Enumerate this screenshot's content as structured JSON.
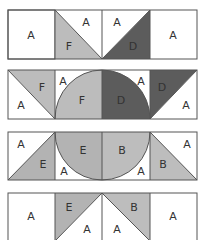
{
  "colors": {
    "A": "#ffffff",
    "B": "#bdbdbd",
    "D": "#5c5c5c",
    "E": "#b3b3b3",
    "F": "#bcbcbc",
    "outline": "#666666"
  },
  "rows": [
    {
      "labels": [
        "A",
        "F",
        "A",
        "A",
        "D",
        "A"
      ]
    },
    {
      "labels": [
        "F",
        "A",
        "A",
        "F",
        "D",
        "A",
        "D",
        "A"
      ]
    },
    {
      "labels": [
        "A",
        "E",
        "E",
        "A",
        "B",
        "A",
        "A",
        "B"
      ]
    },
    {
      "labels": [
        "A",
        "E",
        "A",
        "A",
        "B",
        "A"
      ]
    }
  ],
  "labels": {
    "r1c1": "A",
    "r1c2a": "A",
    "r1c2b": "F",
    "r1c3a": "A",
    "r1c3b": "D",
    "r1c4": "A",
    "r2c1a": "F",
    "r2c1b": "A",
    "r2c2a": "A",
    "r2c2b": "F",
    "r2c3a": "D",
    "r2c3b": "A",
    "r2c4a": "D",
    "r2c4b": "A",
    "r3c1a": "A",
    "r3c1b": "E",
    "r3c2a": "E",
    "r3c2b": "A",
    "r3c3a": "B",
    "r3c3b": "A",
    "r3c4a": "A",
    "r3c4b": "B",
    "r4c1": "A",
    "r4c2a": "E",
    "r4c2b": "A",
    "r4c3a": "A",
    "r4c3b": "B",
    "r4c4": "A"
  }
}
